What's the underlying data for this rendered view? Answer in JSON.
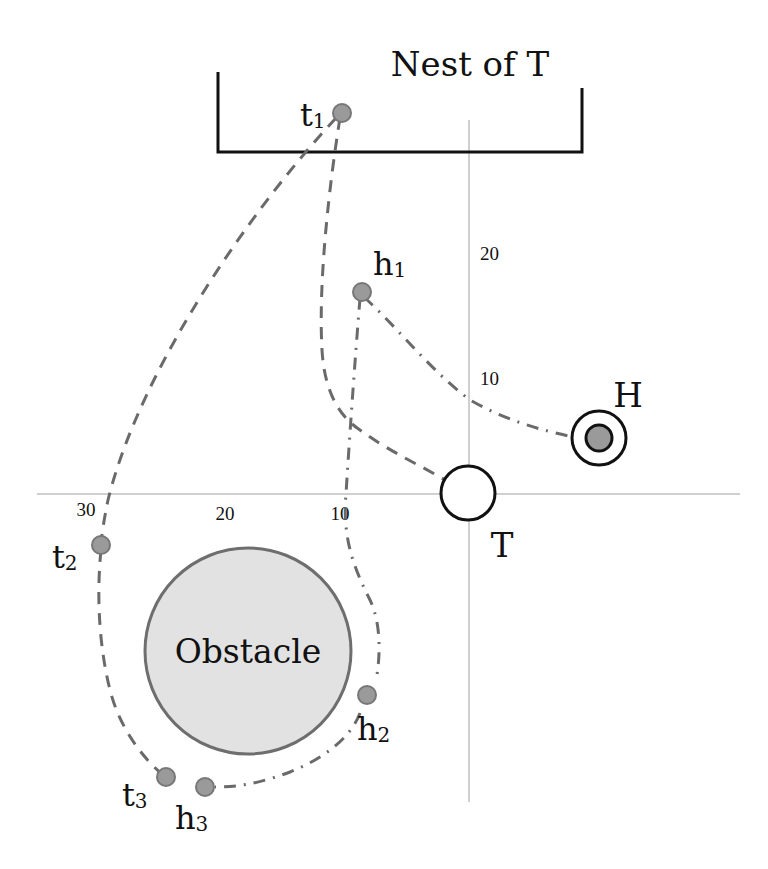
{
  "diagram": {
    "nest": {
      "label": "Nest of T"
    },
    "axes": {
      "y_ticks": [
        {
          "label": "20"
        },
        {
          "label": "10"
        }
      ],
      "x_ticks": [
        {
          "label": "30"
        },
        {
          "label": "20"
        },
        {
          "label": "10"
        }
      ]
    },
    "agents": {
      "target": {
        "label": "T"
      },
      "hunter": {
        "label": "H"
      }
    },
    "obstacle": {
      "label": "Obstacle"
    },
    "points": {
      "t1": {
        "base": "t",
        "sub": "1"
      },
      "t2": {
        "base": "t",
        "sub": "2"
      },
      "t3": {
        "base": "t",
        "sub": "3"
      },
      "h1": {
        "base": "h",
        "sub": "1"
      },
      "h2": {
        "base": "h",
        "sub": "2"
      },
      "h3": {
        "base": "h",
        "sub": "3"
      }
    },
    "colors": {
      "line": "#111111",
      "axis": "#999999",
      "path": "#6a6a6a",
      "point_fill": "#9a9a9a",
      "point_stroke": "#777777",
      "obstacle_fill": "#e2e2e2",
      "obstacle_stroke": "#6e6e6e",
      "hunter_fill": "#9a9a9a"
    }
  }
}
